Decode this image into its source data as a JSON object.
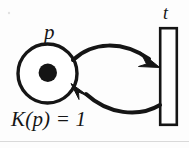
{
  "diagram": {
    "kind": "petri-net",
    "background_color": "#fdfdfd",
    "stroke_color": "#151515",
    "place": {
      "id": "p",
      "label": "p",
      "shape": "circle",
      "center": [
        47.5,
        73.5
      ],
      "radius": 29.5,
      "tokens": 1,
      "token_marking": "●",
      "capacity_label": "K(p) = 1",
      "capacity_value": 1
    },
    "transition": {
      "id": "t",
      "label": "t",
      "shape": "rectangle",
      "x": 160,
      "y": 28,
      "width": 17,
      "height": 97
    },
    "arcs": [
      {
        "name": "arc-place-to-transition",
        "from": "p",
        "to": "t",
        "direction": "place-to-transition",
        "style": "curved",
        "arrowhead": "filled-triangle"
      },
      {
        "name": "arc-transition-to-place",
        "from": "t",
        "to": "p",
        "direction": "transition-to-place",
        "style": "curved",
        "arrowhead": "filled-triangle"
      }
    ]
  }
}
